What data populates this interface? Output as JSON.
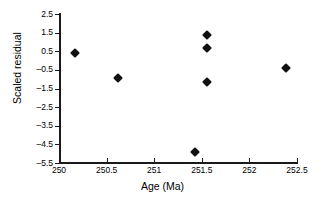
{
  "chart_data": {
    "type": "scatter",
    "title": "",
    "xlabel": "Age (Ma)",
    "ylabel": "Scaled residual",
    "xlim": [
      250,
      252.5
    ],
    "ylim": [
      -5.5,
      2.5
    ],
    "xticks": [
      250,
      250.5,
      251,
      251.5,
      252,
      252.5
    ],
    "xtick_labels": [
      "250",
      "250.5",
      "251",
      "251.5",
      "252",
      "252.5"
    ],
    "yticks": [
      2.5,
      1.5,
      0.5,
      -0.5,
      -1.5,
      -2.5,
      -3.5,
      -4.5,
      -5.5
    ],
    "ytick_labels": [
      "2.5",
      "1.5",
      "0.5",
      "–0.5",
      "–1.5",
      "–2.5",
      "–3.5",
      "–4.5",
      "–5.5"
    ],
    "grid": false,
    "legend": null,
    "marker_style": "filled-diamond",
    "marker_color": "#111111",
    "points": [
      {
        "x": 250.17,
        "y": 0.4
      },
      {
        "x": 250.62,
        "y": -0.95
      },
      {
        "x": 251.43,
        "y": -4.9
      },
      {
        "x": 251.55,
        "y": 1.35
      },
      {
        "x": 251.55,
        "y": 0.65
      },
      {
        "x": 251.55,
        "y": -1.15
      },
      {
        "x": 252.38,
        "y": -0.4
      }
    ]
  }
}
